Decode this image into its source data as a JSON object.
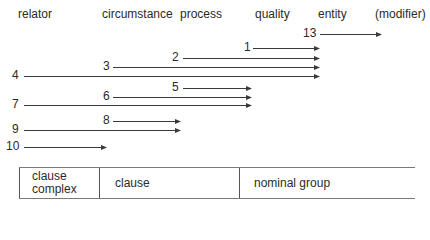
{
  "headers": [
    {
      "label": "relator",
      "x": 18
    },
    {
      "label": "circumstance",
      "x": 102
    },
    {
      "label": "process",
      "x": 180
    },
    {
      "label": "quality",
      "x": 255
    },
    {
      "label": "entity",
      "x": 318
    },
    {
      "label": "(modifier)",
      "x": 375
    }
  ],
  "arrows": [
    {
      "label": "13",
      "label_x": 303,
      "y": 34,
      "x1": 320,
      "x2": 382
    },
    {
      "label": "1",
      "label_x": 244,
      "y": 48,
      "x1": 253,
      "x2": 320
    },
    {
      "label": "2",
      "label_x": 172,
      "y": 58,
      "x1": 183,
      "x2": 320
    },
    {
      "label": "3",
      "label_x": 103,
      "y": 67,
      "x1": 113,
      "x2": 320
    },
    {
      "label": "4",
      "label_x": 12,
      "y": 76,
      "x1": 24,
      "x2": 320
    },
    {
      "label": "5",
      "label_x": 172,
      "y": 88,
      "x1": 183,
      "x2": 252
    },
    {
      "label": "6",
      "label_x": 103,
      "y": 97,
      "x1": 113,
      "x2": 252
    },
    {
      "label": "7",
      "label_x": 12,
      "y": 105,
      "x1": 24,
      "x2": 252
    },
    {
      "label": "8",
      "label_x": 103,
      "y": 121,
      "x1": 113,
      "x2": 181
    },
    {
      "label": "9",
      "label_x": 12,
      "y": 130,
      "x1": 24,
      "x2": 181
    },
    {
      "label": "10",
      "label_x": 6,
      "y": 147,
      "x1": 24,
      "x2": 107
    }
  ],
  "table": {
    "cells": [
      {
        "line1": "clause",
        "line2": "complex"
      },
      {
        "line1": "clause",
        "line2": ""
      },
      {
        "line1": "nominal group",
        "line2": ""
      }
    ]
  },
  "colors": {
    "line": "#3a3a3a",
    "text": "#2a2a2a"
  }
}
